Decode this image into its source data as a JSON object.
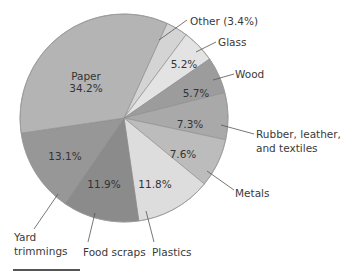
{
  "chart_data": {
    "type": "pie",
    "title": "",
    "start_angle_deg_clockwise_from_top": 24.5,
    "direction": "clockwise",
    "center": [
      124,
      118
    ],
    "radius": 104,
    "slices": [
      {
        "name": "Other",
        "label": "Other (3.4%)",
        "value": 3.4,
        "color": "#d4d4d4",
        "value_label": ""
      },
      {
        "name": "Glass",
        "label": "Glass",
        "value": 5.2,
        "color": "#e3e3e3",
        "value_label": "5.2%"
      },
      {
        "name": "Wood",
        "label": "Wood",
        "value": 5.7,
        "color": "#9c9c9c",
        "value_label": "5.7%"
      },
      {
        "name": "Rubber, leather, and textiles",
        "label": "Rubber, leather,|and textiles",
        "value": 7.3,
        "color": "#a9a9a9",
        "value_label": "7.3%"
      },
      {
        "name": "Metals",
        "label": "Metals",
        "value": 7.6,
        "color": "#bcbcbc",
        "value_label": "7.6%"
      },
      {
        "name": "Plastics",
        "label": "Plastics",
        "value": 11.8,
        "color": "#dddddd",
        "value_label": "11.8%"
      },
      {
        "name": "Food scraps",
        "label": "Food scraps",
        "value": 11.9,
        "color": "#8b8b8b",
        "value_label": "11.9%"
      },
      {
        "name": "Yard trimmings",
        "label": "Yard|trimmings",
        "value": 13.1,
        "color": "#979797",
        "value_label": "13.1%"
      },
      {
        "name": "Paper",
        "label": "Paper",
        "value": 34.2,
        "color": "#b4b4b4",
        "value_label": "34.2%"
      }
    ],
    "categories": [
      "Other",
      "Glass",
      "Wood",
      "Rubber, leather, and textiles",
      "Metals",
      "Plastics",
      "Food scraps",
      "Yard trimmings",
      "Paper"
    ],
    "values": [
      3.4,
      5.2,
      5.7,
      7.3,
      7.6,
      11.8,
      11.9,
      13.1,
      34.2
    ],
    "inner_labels": [
      {
        "slice": "Glass",
        "text": "5.2%",
        "x": 184,
        "y": 68
      },
      {
        "slice": "Wood",
        "text": "5.7%",
        "x": 196,
        "y": 97
      },
      {
        "slice": "Rubber, leather, and textiles",
        "text": "7.3%",
        "x": 190,
        "y": 128
      },
      {
        "slice": "Metals",
        "text": "7.6%",
        "x": 183,
        "y": 158
      },
      {
        "slice": "Plastics",
        "text": "11.8%",
        "x": 155,
        "y": 188
      },
      {
        "slice": "Food scraps",
        "text": "11.9%",
        "x": 104,
        "y": 188
      },
      {
        "slice": "Yard trimmings",
        "text": "13.1%",
        "x": 65,
        "y": 160
      },
      {
        "slice": "Paper",
        "text": "Paper",
        "x": 86,
        "y": 80
      },
      {
        "slice": "Paper",
        "text": "34.2%",
        "x": 86,
        "y": 92
      }
    ],
    "outer_labels": [
      {
        "slice": "Other",
        "lines": [
          "Other (3.4%)"
        ],
        "x": 190,
        "y": 25,
        "anchor": "start",
        "leader": [
          [
            159,
            40
          ],
          [
            187,
            20
          ]
        ]
      },
      {
        "slice": "Glass",
        "lines": [
          "Glass"
        ],
        "x": 218,
        "y": 46,
        "anchor": "start",
        "leader": [
          [
            196,
            52
          ],
          [
            216,
            42
          ]
        ]
      },
      {
        "slice": "Wood",
        "lines": [
          "Wood"
        ],
        "x": 235,
        "y": 78,
        "anchor": "start",
        "leader": [
          [
            213,
            80
          ],
          [
            234,
            74
          ]
        ]
      },
      {
        "slice": "Rubber, leather, and textiles",
        "lines": [
          "Rubber, leather,",
          "and textiles"
        ],
        "x": 256,
        "y": 138,
        "anchor": "start",
        "leader": [
          [
            221,
            125
          ],
          [
            254,
            134
          ]
        ]
      },
      {
        "slice": "Metals",
        "lines": [
          "Metals"
        ],
        "x": 235,
        "y": 197,
        "anchor": "start",
        "leader": [
          [
            207,
            171
          ],
          [
            234,
            190
          ]
        ]
      },
      {
        "slice": "Plastics",
        "lines": [
          "Plastics"
        ],
        "x": 152,
        "y": 256,
        "anchor": "start",
        "leader": [
          [
            146,
            211
          ],
          [
            154,
            242
          ]
        ]
      },
      {
        "slice": "Food scraps",
        "lines": [
          "Food scraps"
        ],
        "x": 83,
        "y": 256,
        "anchor": "start",
        "leader": [
          [
            95,
            213
          ],
          [
            88,
            242
          ]
        ]
      },
      {
        "slice": "Yard trimmings",
        "lines": [
          "Yard",
          "trimmings"
        ],
        "x": 14,
        "y": 241,
        "anchor": "start",
        "leader": [
          [
            58,
            194
          ],
          [
            34,
            229
          ]
        ]
      }
    ]
  },
  "footer": {
    "rule": true
  }
}
